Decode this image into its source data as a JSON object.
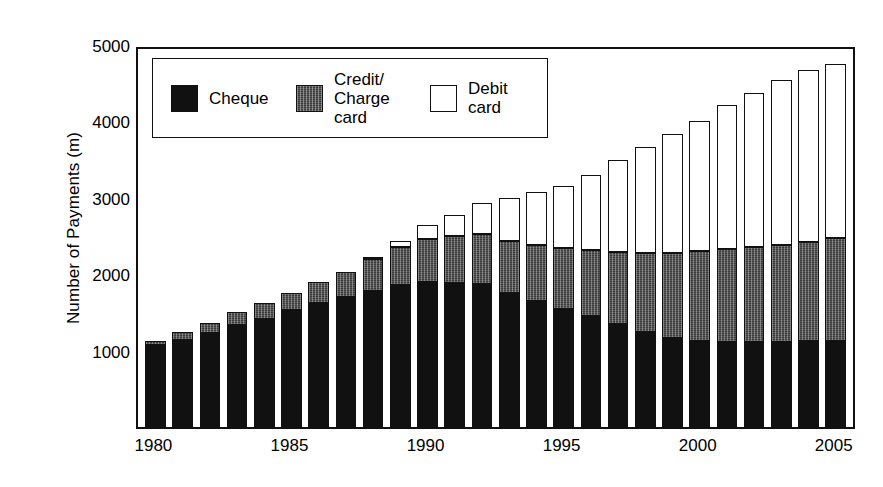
{
  "chart_data": {
    "type": "bar",
    "stacked": true,
    "title": "",
    "subtitle": "",
    "xlabel": "",
    "ylabel": "Number of Payments (m)",
    "ylim": [
      0,
      5000
    ],
    "ytick_labels": [
      "1000",
      "2000",
      "3000",
      "4000",
      "5000"
    ],
    "yticks": [
      1000,
      2000,
      3000,
      4000,
      5000
    ],
    "xtick_labels": [
      "1980",
      "1985",
      "1990",
      "1995",
      "2000",
      "2005"
    ],
    "xticks": [
      1980,
      1985,
      1990,
      1995,
      2000,
      2005
    ],
    "grid": false,
    "legend_position": "top-left-inside",
    "categories": [
      "1980",
      "1981",
      "1982",
      "1983",
      "1984",
      "1985",
      "1986",
      "1987",
      "1988",
      "1989",
      "1990",
      "1991",
      "1992",
      "1993",
      "1994",
      "1995",
      "1996",
      "1997",
      "1998",
      "1999",
      "2000",
      "2001",
      "2002",
      "2003",
      "2004",
      "2005"
    ],
    "series": [
      {
        "name": "Cheque",
        "color": "#111111",
        "pattern": "solid-black",
        "values": [
          1080,
          1140,
          1230,
          1330,
          1420,
          1530,
          1620,
          1700,
          1780,
          1860,
          1900,
          1890,
          1870,
          1760,
          1650,
          1540,
          1450,
          1350,
          1250,
          1170,
          1120,
          1110,
          1110,
          1110,
          1120,
          1130
        ]
      },
      {
        "name": "Credit/Charge card",
        "color": "#3a3a3a",
        "pattern": "hatched-dark",
        "values": [
          50,
          110,
          130,
          170,
          200,
          230,
          280,
          330,
          420,
          500,
          560,
          610,
          660,
          680,
          730,
          800,
          870,
          940,
          1030,
          1110,
          1180,
          1220,
          1250,
          1270,
          1300,
          1340
        ]
      },
      {
        "name": "Debit card",
        "color": "#ffffff",
        "pattern": "open-white",
        "values": [
          0,
          0,
          0,
          0,
          0,
          0,
          0,
          0,
          10,
          70,
          180,
          280,
          400,
          560,
          690,
          810,
          980,
          1200,
          1380,
          1560,
          1710,
          1880,
          2010,
          2160,
          2250,
          2280
        ]
      }
    ],
    "totals": [
      1130,
      1250,
      1360,
      1500,
      1620,
      1760,
      1900,
      2030,
      2210,
      2430,
      2640,
      2780,
      2930,
      3000,
      3070,
      3150,
      3300,
      3490,
      3660,
      3840,
      4010,
      4210,
      4370,
      4540,
      4670,
      4750
    ]
  },
  "axes": {
    "y_title": "Number of Payments (m)"
  },
  "legend": {
    "entries": [
      {
        "label": "Cheque",
        "swatch": "solid-black"
      },
      {
        "label": "Credit/\nCharge\ncard",
        "swatch": "hatched-dark"
      },
      {
        "label": "Debit\ncard",
        "swatch": "open-white"
      }
    ]
  }
}
